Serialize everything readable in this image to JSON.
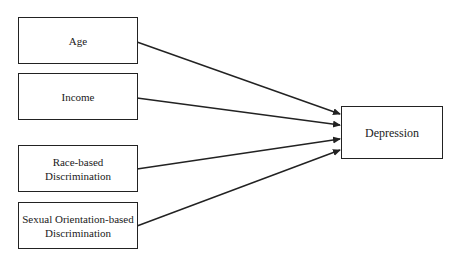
{
  "diagram": {
    "predictors": [
      {
        "id": "age",
        "lines": [
          "Age"
        ]
      },
      {
        "id": "income",
        "lines": [
          "Income"
        ]
      },
      {
        "id": "race",
        "lines": [
          "Race-based",
          "Discrimination"
        ]
      },
      {
        "id": "sexual",
        "lines": [
          "Sexual Orientation-based",
          "Discrimination"
        ]
      }
    ],
    "outcome": {
      "id": "depression",
      "label": "Depression"
    },
    "edges": [
      {
        "from": "age",
        "to": "depression"
      },
      {
        "from": "income",
        "to": "depression"
      },
      {
        "from": "race",
        "to": "depression"
      },
      {
        "from": "sexual",
        "to": "depression"
      }
    ],
    "colors": {
      "stroke": "#222222",
      "background": "#ffffff"
    }
  }
}
